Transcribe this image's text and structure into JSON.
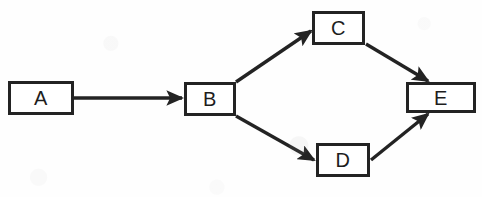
{
  "diagram": {
    "background_color": "#ffffff",
    "stroke_color": "#232323",
    "label_color": "#1d1d1d",
    "canvas": {
      "width": 482,
      "height": 197
    },
    "nodes": [
      {
        "id": "A",
        "label": "A",
        "x": 8,
        "y": 81,
        "width": 66,
        "height": 34
      },
      {
        "id": "B",
        "label": "B",
        "x": 184,
        "y": 82,
        "width": 52,
        "height": 34
      },
      {
        "id": "C",
        "label": "C",
        "x": 312,
        "y": 11,
        "width": 53,
        "height": 34
      },
      {
        "id": "D",
        "label": "D",
        "x": 316,
        "y": 143,
        "width": 54,
        "height": 34
      },
      {
        "id": "E",
        "label": "E",
        "x": 406,
        "y": 82,
        "width": 70,
        "height": 31
      }
    ],
    "edges": [
      {
        "id": "A-B",
        "from": "A",
        "to": "B",
        "x1": 74,
        "y1": 98,
        "x2": 182,
        "y2": 98,
        "direction": "right"
      },
      {
        "id": "B-C",
        "from": "B",
        "to": "C",
        "x1": 236,
        "y1": 82,
        "x2": 311,
        "y2": 31,
        "direction": "up-right"
      },
      {
        "id": "B-D",
        "from": "B",
        "to": "D",
        "x1": 236,
        "y1": 116,
        "x2": 314,
        "y2": 160,
        "direction": "down-right"
      },
      {
        "id": "C-E",
        "from": "C",
        "to": "E",
        "x1": 366,
        "y1": 44,
        "x2": 428,
        "y2": 81,
        "direction": "down-right"
      },
      {
        "id": "D-E",
        "from": "D",
        "to": "E",
        "x1": 371,
        "y1": 160,
        "x2": 428,
        "y2": 114,
        "direction": "up-right"
      }
    ]
  }
}
